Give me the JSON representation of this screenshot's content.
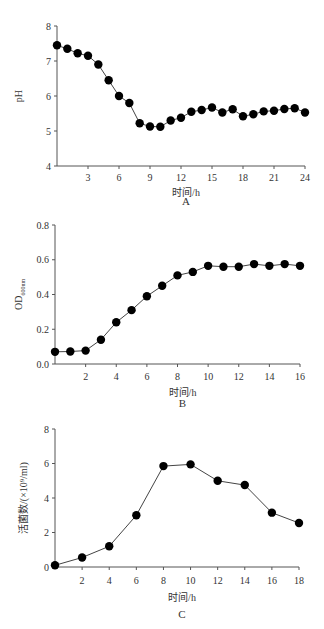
{
  "chart_data": [
    {
      "id": "A",
      "type": "line",
      "caption": "A",
      "xlabel": "时间/h",
      "ylabel": "pH",
      "xlim": [
        0,
        24
      ],
      "ylim": [
        4,
        8
      ],
      "xticks": [
        3,
        6,
        9,
        12,
        15,
        18,
        21,
        24
      ],
      "yticks": [
        4,
        5,
        6,
        7,
        8
      ],
      "grid": false,
      "x": [
        0,
        1,
        2,
        3,
        4,
        5,
        6,
        7,
        8,
        9,
        10,
        11,
        12,
        13,
        14,
        15,
        16,
        17,
        18,
        19,
        20,
        21,
        22,
        23,
        24
      ],
      "values": [
        7.45,
        7.35,
        7.22,
        7.15,
        6.9,
        6.45,
        6.0,
        5.8,
        5.22,
        5.13,
        5.12,
        5.3,
        5.38,
        5.55,
        5.6,
        5.67,
        5.53,
        5.62,
        5.42,
        5.48,
        5.56,
        5.58,
        5.63,
        5.65,
        5.53
      ]
    },
    {
      "id": "B",
      "type": "line",
      "caption": "B",
      "xlabel": "时间/h",
      "ylabel": "OD",
      "ylabel_sub": "600nm",
      "xlim": [
        0,
        16
      ],
      "ylim": [
        0,
        0.8
      ],
      "xticks": [
        2,
        4,
        6,
        8,
        10,
        12,
        14,
        16
      ],
      "yticks": [
        "0.0",
        "0.2",
        "0.4",
        "0.6",
        "0.8"
      ],
      "grid": false,
      "x": [
        0,
        1,
        2,
        3,
        4,
        5,
        6,
        7,
        8,
        9,
        10,
        11,
        12,
        13,
        14,
        15,
        16
      ],
      "values": [
        0.07,
        0.072,
        0.077,
        0.14,
        0.24,
        0.31,
        0.39,
        0.45,
        0.51,
        0.53,
        0.565,
        0.56,
        0.56,
        0.575,
        0.565,
        0.575,
        0.565
      ]
    },
    {
      "id": "C",
      "type": "line",
      "caption": "C",
      "xlabel": "时间/h",
      "ylabel": "活菌数/(×10⁹/ml)",
      "xlim": [
        0,
        18
      ],
      "ylim": [
        0,
        8
      ],
      "xticks": [
        2,
        4,
        6,
        8,
        10,
        12,
        14,
        16,
        18
      ],
      "yticks": [
        0,
        2,
        4,
        6,
        8
      ],
      "grid": false,
      "x": [
        0,
        2,
        4,
        6,
        8,
        10,
        12,
        14,
        16,
        18
      ],
      "values": [
        0.1,
        0.55,
        1.2,
        3.0,
        5.85,
        5.95,
        5.0,
        4.75,
        3.15,
        2.55
      ]
    }
  ]
}
